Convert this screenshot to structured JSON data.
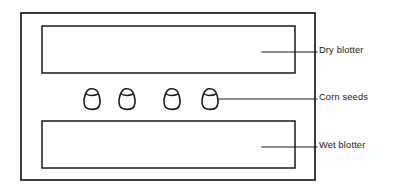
{
  "figure": {
    "width": 396,
    "height": 193,
    "background_color": "#ffffff",
    "line_color": "#1a1a1a"
  },
  "container": {
    "name": "outer-container",
    "x": 21,
    "y": 13,
    "width": 294,
    "height": 167
  },
  "blotters": [
    {
      "id": "dry-blotter",
      "label": "Dry blotter",
      "x": 42,
      "y": 26,
      "width": 253,
      "height": 47
    },
    {
      "id": "wet-blotter",
      "label": "Wet blotter",
      "x": 42,
      "y": 121,
      "width": 253,
      "height": 47
    }
  ],
  "seeds": {
    "label": "Corn seeds",
    "count": 4,
    "positions_x": [
      92,
      127,
      172,
      210
    ],
    "center_y": 99
  },
  "callouts": [
    {
      "id": "callout-dry-blotter",
      "text": "Dry blotter",
      "leader_start_x": 262,
      "leader_start_y": 52,
      "leader_end_x": 317,
      "leader_end_y": 52
    },
    {
      "id": "callout-corn-seeds",
      "text": "Corn seeds",
      "leader_start_x": 219,
      "leader_start_y": 99,
      "leader_end_x": 317,
      "leader_end_y": 99
    },
    {
      "id": "callout-wet-blotter",
      "text": "Wet blotter",
      "leader_start_x": 262,
      "leader_start_y": 147,
      "leader_end_x": 317,
      "leader_end_y": 147
    }
  ]
}
